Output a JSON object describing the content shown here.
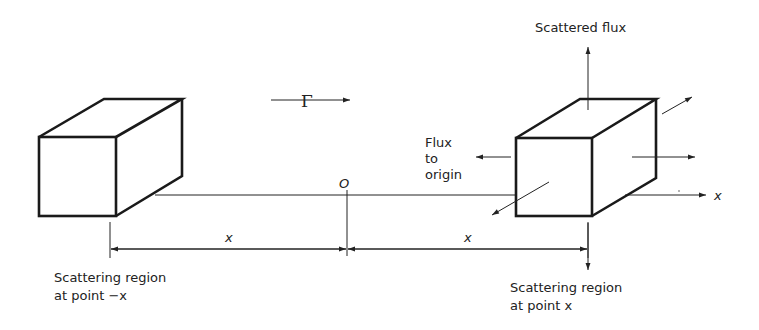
{
  "diagram": {
    "flow_symbol": "Γ",
    "origin_label": "O",
    "axis_label": "x",
    "left_distance_label": "x",
    "right_distance_label": "x",
    "scattered_flux_label": "Scattered flux",
    "flux_to_origin_lines": [
      "Flux",
      "to",
      "origin"
    ],
    "left_region_lines": [
      "Scattering region",
      "at point −x"
    ],
    "right_region_lines": [
      "Scattering region",
      "at point x"
    ]
  }
}
